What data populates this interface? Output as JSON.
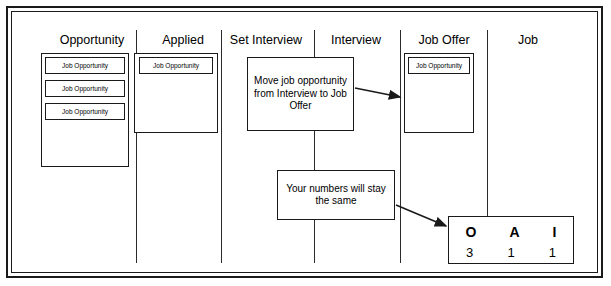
{
  "board": {
    "columns": [
      {
        "title": "Opportunity",
        "x": 44,
        "width": 96
      },
      {
        "title": "Applied",
        "x": 144,
        "width": 78
      },
      {
        "title": "Set Interview",
        "x": 220,
        "width": 92
      },
      {
        "title": "Interview",
        "x": 318,
        "width": 76
      },
      {
        "title": "Job Offer",
        "x": 408,
        "width": 72
      },
      {
        "title": "Job",
        "x": 508,
        "width": 40
      }
    ],
    "dividers_x": [
      136,
      221,
      314,
      400,
      487
    ],
    "card_label": "Job Opportunity",
    "opportunity_cards": 3,
    "applied_cards": 1,
    "joboffer_cards": 1
  },
  "notes": [
    {
      "id": "note-move-job",
      "text": "Move job opportunity from Interview to Job Offer"
    },
    {
      "id": "note-numbers",
      "text": "Your numbers will stay the same"
    }
  ],
  "score": {
    "letters": [
      "O",
      "A",
      "I"
    ],
    "values": [
      "3",
      "1",
      "1"
    ]
  },
  "colors": {
    "line": "#1a1a1a",
    "background": "#ffffff"
  }
}
